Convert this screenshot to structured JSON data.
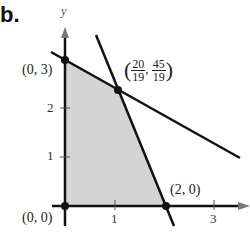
{
  "figure": {
    "part_label": "b.",
    "axes": {
      "x_label": "",
      "y_label": "y",
      "x_ticks": [
        "1",
        "3"
      ],
      "y_ticks": [
        "1",
        "2"
      ]
    },
    "vertices": [
      {
        "label": "(0, 0)",
        "x": 0,
        "y": 0
      },
      {
        "label": "(0, 3)",
        "x": 0,
        "y": 3
      },
      {
        "label_num_x": "20",
        "label_den_x": "19",
        "label_num_y": "45",
        "label_den_y": "19",
        "x": 1.0526,
        "y": 2.3684
      },
      {
        "label": "(2, 0)",
        "x": 2,
        "y": 0
      }
    ],
    "lines": [
      {
        "name": "line-1",
        "equation": "3x + 4y = 12"
      },
      {
        "name": "line-2",
        "equation": "5x + 2y = 10"
      }
    ],
    "colors": {
      "shade": "#d4d4d4",
      "line": "#111111",
      "axis": "#111111"
    }
  }
}
